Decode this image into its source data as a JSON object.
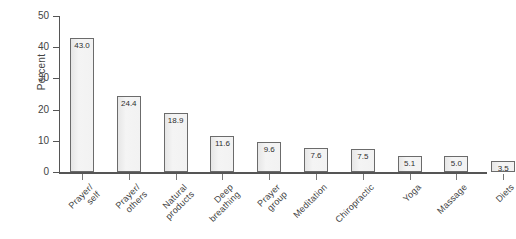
{
  "chart_data": {
    "type": "bar",
    "title": "",
    "xlabel": "",
    "ylabel": "Percent",
    "ylim": [
      0,
      50
    ],
    "yticks": [
      0,
      10,
      20,
      30,
      40,
      50
    ],
    "grid": false,
    "legend": false,
    "categories": [
      "Prayer/ self",
      "Prayer/ others",
      "Natural products",
      "Deep breathing",
      "Prayer group",
      "Meditation",
      "Chiropractic",
      "Yoga",
      "Massage",
      "Diets"
    ],
    "category_lines": [
      [
        "Prayer/",
        "self"
      ],
      [
        "Prayer/",
        "others"
      ],
      [
        "Natural",
        "products"
      ],
      [
        "Deep",
        "breathing"
      ],
      [
        "Prayer",
        "group"
      ],
      [
        "Meditation",
        ""
      ],
      [
        "Chiropractic",
        ""
      ],
      [
        "Yoga",
        ""
      ],
      [
        "Massage",
        ""
      ],
      [
        "Diets",
        ""
      ]
    ],
    "values": [
      43.0,
      24.4,
      18.9,
      11.6,
      9.6,
      7.6,
      7.5,
      5.1,
      5.0,
      3.5
    ],
    "value_labels": [
      "43.0",
      "24.4",
      "18.9",
      "11.6",
      "9.6",
      "7.6",
      "7.5",
      "5.1",
      "5.0",
      "3.5"
    ],
    "bar_fill_color": "#efefef",
    "bar_border_color": "#6b6b6b",
    "axis_color": "#555555",
    "text_color": "#3f3f3f"
  }
}
